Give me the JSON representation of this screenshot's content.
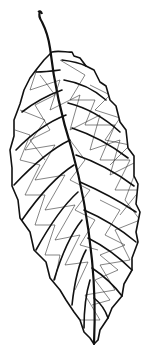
{
  "image": {
    "subject": "leaf line drawing",
    "description": "Black-and-white illustration of a serrated elliptical leaf with petiole, midrib, pinnate secondary veins and reticulate vein network",
    "colors": {
      "background": "#ffffff",
      "ink": "#111111"
    },
    "vein_pairs": 9
  }
}
